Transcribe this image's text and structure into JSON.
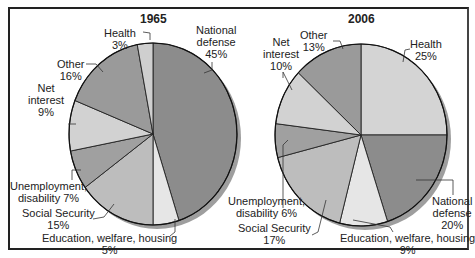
{
  "chart_data": [
    {
      "type": "pie",
      "title": "1965",
      "categories": [
        "National defense",
        "Education, welfare, housing",
        "Social Security",
        "Unemployment, disability",
        "Net interest",
        "Other",
        "Health"
      ],
      "values": [
        45,
        5,
        15,
        7,
        9,
        16,
        3
      ],
      "colors": [
        "#8c8c8c",
        "#e6e6e6",
        "#bdbdbd",
        "#a0a0a0",
        "#d2d2d2",
        "#9a9a9a",
        "#cfcfcf"
      ]
    },
    {
      "type": "pie",
      "title": "2006",
      "categories": [
        "Health",
        "National defense",
        "Education, welfare, housing",
        "Social Security",
        "Unemployment, disability",
        "Net interest",
        "Other"
      ],
      "values": [
        25,
        20,
        9,
        17,
        6,
        10,
        13
      ],
      "colors": [
        "#d4d4d4",
        "#8c8c8c",
        "#e6e6e6",
        "#bdbdbd",
        "#a0a0a0",
        "#d2d2d2",
        "#9a9a9a"
      ]
    }
  ],
  "left": {
    "title": "1965",
    "labels": {
      "national_defense": [
        "National",
        "defense",
        "45%"
      ],
      "health": [
        "Health",
        "3%"
      ],
      "other": [
        "Other",
        "16%"
      ],
      "net_interest": [
        "Net",
        "interest",
        "9%"
      ],
      "unemployment": [
        "Unemployment,",
        "disability 7%"
      ],
      "social_security": [
        "Social Security",
        "15%"
      ],
      "education": [
        "Education, welfare, housing",
        "5%"
      ]
    }
  },
  "right": {
    "title": "2006",
    "labels": {
      "health": [
        "Health",
        "25%"
      ],
      "other": [
        "Other",
        "13%"
      ],
      "net_interest": [
        "Net",
        "interest",
        "10%"
      ],
      "unemployment": [
        "Unemployment,",
        "disability 6%"
      ],
      "social_security": [
        "Social Security",
        "17%"
      ],
      "education": [
        "Education, welfare, housing",
        "9%"
      ],
      "national_defense": [
        "National",
        "defense",
        "20%"
      ]
    }
  }
}
